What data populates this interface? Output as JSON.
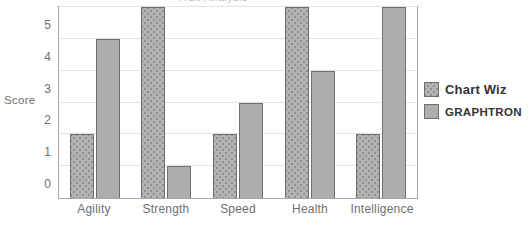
{
  "chart_data": {
    "type": "bar",
    "title": "Trait Analysis",
    "xlabel": "Trait",
    "ylabel": "Score",
    "categories": [
      "Agility",
      "Strength",
      "Speed",
      "Health",
      "Intelligence"
    ],
    "series": [
      {
        "name": "Chart Wiz",
        "values": [
          2,
          6,
          2,
          6,
          2
        ],
        "color": "#b3b3b3",
        "pattern": "dotted"
      },
      {
        "name": "GRAPHTRON",
        "values": [
          5,
          1,
          3,
          4,
          6
        ],
        "color": "#adadad",
        "pattern": "solid"
      }
    ],
    "ylim": [
      0,
      6
    ],
    "yticks": [
      0,
      1,
      2,
      3,
      4,
      5,
      6
    ],
    "grid": true,
    "legend_position": "right"
  },
  "legend": {
    "entries": [
      {
        "label": "Chart Wiz"
      },
      {
        "label": "GRAPHTRON"
      }
    ]
  },
  "axes": {
    "y_title": "Score",
    "x_title": "Trait"
  }
}
